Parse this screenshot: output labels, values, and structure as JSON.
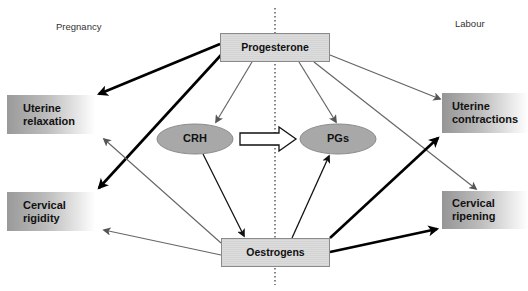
{
  "phases": {
    "left": "Pregnancy",
    "right": "Labour"
  },
  "hormones": {
    "top": "Progesterone",
    "bottom": "Oestrogens"
  },
  "mediators": {
    "left": "CRH",
    "right": "PGs"
  },
  "effects": {
    "uterine_relaxation": "Uterine\nrelaxation",
    "cervical_rigidity": "Cervical\nrigidity",
    "uterine_contractions": "Uterine\ncontractions",
    "cervical_ripening": "Cervical\nripening"
  },
  "effect_lines": {
    "uterine_relaxation": [
      "Uterine",
      "relaxation"
    ],
    "cervical_rigidity": [
      "Cervical",
      "rigidity"
    ],
    "uterine_contractions": [
      "Uterine",
      "contractions"
    ],
    "cervical_ripening": [
      "Cervical",
      "ripening"
    ]
  },
  "colors": {
    "strong_arrow": "#000000",
    "weak_arrow": "#666666",
    "ellipse_fill": "#a8a8a8",
    "hormone_fill": "#d8d8d8"
  },
  "edges": [
    {
      "from": "Progesterone",
      "to": "Uterine relaxation",
      "weight": "strong"
    },
    {
      "from": "Progesterone",
      "to": "Cervical rigidity",
      "weight": "strong"
    },
    {
      "from": "Progesterone",
      "to": "CRH",
      "weight": "weak"
    },
    {
      "from": "Progesterone",
      "to": "PGs",
      "weight": "weak"
    },
    {
      "from": "Progesterone",
      "to": "Uterine contractions",
      "weight": "weak"
    },
    {
      "from": "Progesterone",
      "to": "Cervical ripening",
      "weight": "weak"
    },
    {
      "from": "CRH",
      "to": "PGs",
      "weight": "hollow"
    },
    {
      "from": "CRH",
      "to": "Oestrogens",
      "weight": "medium"
    },
    {
      "from": "Oestrogens",
      "to": "PGs",
      "weight": "medium"
    },
    {
      "from": "Oestrogens",
      "to": "Uterine relaxation",
      "weight": "weak"
    },
    {
      "from": "Oestrogens",
      "to": "Cervical rigidity",
      "weight": "weak"
    },
    {
      "from": "Oestrogens",
      "to": "Uterine contractions",
      "weight": "strong"
    },
    {
      "from": "Oestrogens",
      "to": "Cervical ripening",
      "weight": "strong"
    }
  ]
}
